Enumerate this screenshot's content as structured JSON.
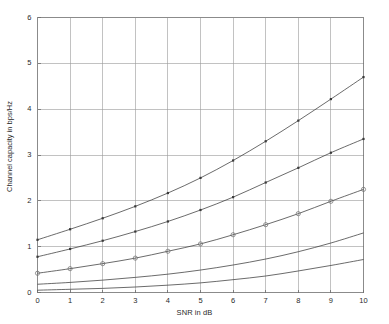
{
  "chart_data": {
    "type": "line",
    "title": "",
    "subtitle": "",
    "xlabel": "SNR in dB",
    "ylabel": "Channel capacity in bps/Hz",
    "xlim": [
      0,
      10
    ],
    "ylim": [
      0,
      6
    ],
    "xticks": [
      "0",
      "1",
      "2",
      "3",
      "4",
      "5",
      "6",
      "7",
      "8",
      "9",
      "10"
    ],
    "yticks": [
      "0",
      "1",
      "2",
      "3",
      "4",
      "5",
      "6"
    ],
    "grid": true,
    "legend": "none",
    "x": [
      0,
      1,
      2,
      3,
      4,
      5,
      6,
      7,
      8,
      9,
      10
    ],
    "series": [
      {
        "name": "curve-1",
        "marker": "dot",
        "values": [
          1.15,
          1.38,
          1.62,
          1.88,
          2.17,
          2.5,
          2.88,
          3.3,
          3.75,
          4.22,
          4.7
        ]
      },
      {
        "name": "curve-2",
        "marker": "dot",
        "values": [
          0.78,
          0.95,
          1.13,
          1.33,
          1.55,
          1.8,
          2.08,
          2.4,
          2.72,
          3.05,
          3.35
        ]
      },
      {
        "name": "curve-3",
        "marker": "circle",
        "values": [
          0.42,
          0.52,
          0.63,
          0.75,
          0.9,
          1.06,
          1.26,
          1.48,
          1.72,
          1.99,
          2.25
        ]
      },
      {
        "name": "curve-4",
        "marker": "none",
        "values": [
          0.18,
          0.22,
          0.27,
          0.33,
          0.4,
          0.49,
          0.6,
          0.73,
          0.89,
          1.08,
          1.3
        ]
      },
      {
        "name": "curve-5",
        "marker": "none",
        "values": [
          0.05,
          0.07,
          0.09,
          0.12,
          0.16,
          0.21,
          0.28,
          0.36,
          0.47,
          0.59,
          0.72
        ]
      }
    ],
    "colors": {
      "curve": "#3a3a3a",
      "grid": "#9a9a9a",
      "axis": "#6e6e6e",
      "background": "#ffffff",
      "text": "#2a2a2a"
    }
  }
}
